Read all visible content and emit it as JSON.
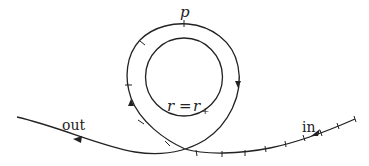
{
  "diagram": {
    "type": "orbit-trajectory",
    "labels": {
      "point": "p",
      "horizon_lhs": "r",
      "horizon_eq": "=",
      "horizon_rhs": "r",
      "horizon_sub": "+",
      "incoming": "in",
      "outgoing": "out"
    },
    "colors": {
      "stroke": "#222222",
      "background": "#ffffff"
    }
  }
}
